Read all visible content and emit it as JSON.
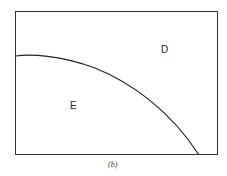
{
  "figure": {
    "caption": "(b)",
    "regions": [
      {
        "label": "D",
        "x": 162,
        "y": 45
      },
      {
        "label": "E",
        "x": 71,
        "y": 101
      }
    ],
    "frame": {
      "x": 15,
      "y": 11,
      "width": 203,
      "height": 144
    },
    "curve": "concave-down boundary from left edge to bottom edge",
    "stroke_color": "#222222"
  }
}
